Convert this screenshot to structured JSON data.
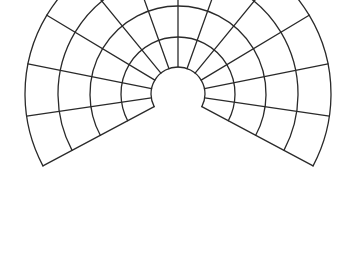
{
  "diagram": {
    "title": "",
    "type": "map-projection-graticule",
    "center": [
      178,
      94
    ],
    "parallel_radii": [
      27,
      57,
      88,
      120,
      153
    ],
    "sweep_start_deg": 208,
    "sweep_end_deg": -28,
    "meridian_count": 13,
    "stroke_color": "#2a2a2a",
    "background_color": "#ffffff"
  }
}
